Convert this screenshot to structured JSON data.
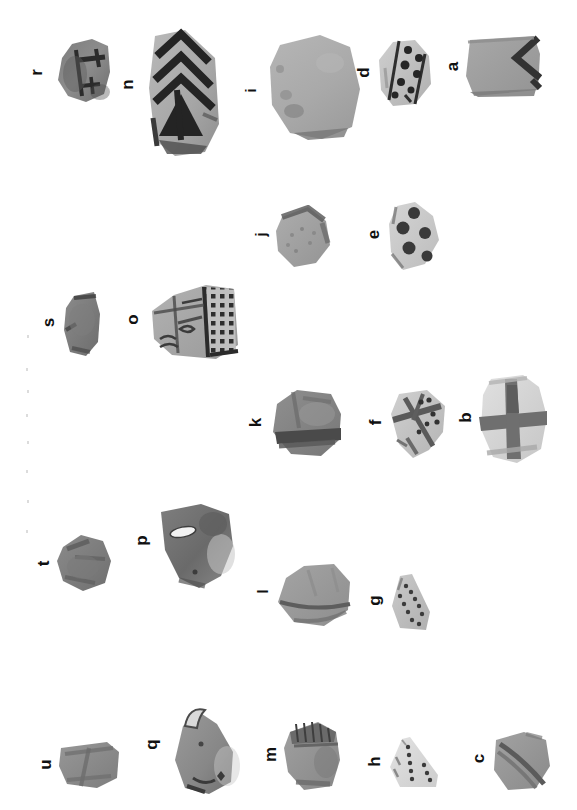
{
  "plate": {
    "title": "Photographic plate of decorated pottery sherds",
    "orientation": "rotated-90-ccw",
    "background_color": "#ffffff",
    "label_color": "#111111",
    "specimen_count": 21
  },
  "specimens": [
    {
      "label": "r",
      "description": "Sherd with two dark painted cross / ladder motifs on a mid-grey body",
      "decoration": "cross-bars",
      "tone": "dark-grey"
    },
    {
      "label": "n",
      "description": "Tall sherd with nested dark chevrons above a solid filled triangle",
      "decoration": "nested-chevrons",
      "tone": "light-grey"
    },
    {
      "label": "i",
      "description": "Large plain sherd, light grey, undecorated with mottled surface",
      "decoration": "plain",
      "tone": "light-grey"
    },
    {
      "label": "d",
      "description": "Sherd with a diagonal band flanked by rows of dark painted dots",
      "decoration": "dotted-band",
      "tone": "light"
    },
    {
      "label": "a",
      "description": "Rectangular sherd with a bold dark zigzag along one edge",
      "decoration": "zigzag",
      "tone": "mid-grey"
    },
    {
      "label": "s",
      "description": "Small dark sherd, faint surface marks, no clear decoration",
      "decoration": "plain",
      "tone": "dark-grey"
    },
    {
      "label": "j",
      "description": "Mottled sherd with coarse speckled surface and darker upper edge",
      "decoration": "plain",
      "tone": "mid-grey"
    },
    {
      "label": "e",
      "description": "Light sherd painted with five large dark filled circles",
      "decoration": "large-dots",
      "tone": "light"
    },
    {
      "label": "o",
      "description": "Sherd with panelled geometric design: dense square dot grid beside hatched and scroll panels",
      "decoration": "panelled-dot-grid",
      "tone": "mid-grey"
    },
    {
      "label": "k",
      "description": "Dark sherd with a broad horizontal painted band near the lower edge",
      "decoration": "horizontal-band",
      "tone": "dark-grey"
    },
    {
      "label": "f",
      "description": "Light sherd with crossing diagonal bands and small dots in the fields",
      "decoration": "crossed-bands-with-dots",
      "tone": "light"
    },
    {
      "label": "b",
      "description": "Pale sherd with a bold painted cross of one horizontal and one vertical band",
      "decoration": "painted-cross",
      "tone": "very-light"
    },
    {
      "label": "t",
      "description": "Small dark irregular sherd, plain surface",
      "decoration": "plain",
      "tone": "dark-grey"
    },
    {
      "label": "p",
      "description": "Dark sherd with a white elongated inclusion or spall near the upper edge",
      "decoration": "plain",
      "tone": "dark-grey"
    },
    {
      "label": "l",
      "description": "Grey sherd with a long horizontal incised or painted line across the lower body",
      "decoration": "single-line",
      "tone": "mid-grey"
    },
    {
      "label": "g",
      "description": "Small triangular sherd with curved rows of small dark dots",
      "decoration": "dot-rows",
      "tone": "light"
    },
    {
      "label": "u",
      "description": "Small rectangular dark sherd with a faint diagonal break line",
      "decoration": "plain",
      "tone": "dark-grey"
    },
    {
      "label": "q",
      "description": "Sherd with a projecting lug or handle stub at one corner",
      "decoration": "lug-handle",
      "tone": "mid-grey"
    },
    {
      "label": "m",
      "description": "Sherd with a dark notched rim band along the top edge",
      "decoration": "notched-rim",
      "tone": "mid-grey"
    },
    {
      "label": "h",
      "description": "Small pale triangular sherd with two converging lines of dark dots",
      "decoration": "dot-lines",
      "tone": "very-light"
    },
    {
      "label": "c",
      "description": "Grey sherd with a diagonal dark painted band across the face",
      "decoration": "diagonal-band",
      "tone": "mid-grey"
    }
  ]
}
